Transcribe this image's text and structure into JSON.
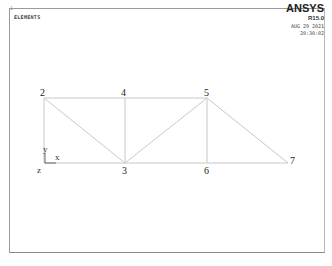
{
  "window": {
    "corner_index": "1",
    "plot_title": "ELEMENTS",
    "brand": "ANSYS",
    "version": "R15.0",
    "date": "AUG 29 2021",
    "time": "20:30:02"
  },
  "truss": {
    "line_color": "#c8c8c8",
    "nodes": [
      {
        "id": "2",
        "x": 44,
        "y": 98
      },
      {
        "id": "4",
        "x": 125,
        "y": 98
      },
      {
        "id": "5",
        "x": 207,
        "y": 98
      },
      {
        "id": "3",
        "x": 125,
        "y": 163
      },
      {
        "id": "6",
        "x": 207,
        "y": 163
      },
      {
        "id": "7",
        "x": 288,
        "y": 163
      }
    ],
    "labels": {
      "n2": "2",
      "n4": "4",
      "n5": "5",
      "n3": "3",
      "n6": "6",
      "n7": "7"
    }
  },
  "triad": {
    "x_label": "x",
    "y_label": "y",
    "z_label": "z"
  }
}
